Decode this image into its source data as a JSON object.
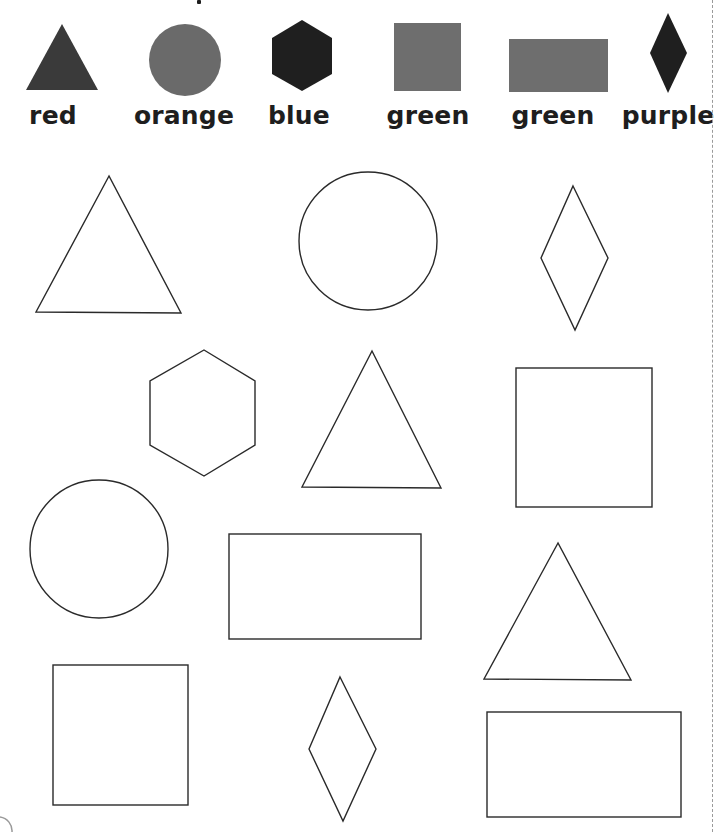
{
  "worksheet": {
    "title_fragment": "",
    "key": [
      {
        "shape": "triangle",
        "color_word": "red",
        "fill": "#3a3a3a",
        "label_x": 53,
        "points": "26,90 62,24 98,90"
      },
      {
        "shape": "circle",
        "color_word": "orange",
        "fill": "#6a6a6a",
        "label_x": 184,
        "cx": 185,
        "cy": 60,
        "r": 36
      },
      {
        "shape": "hexagon",
        "color_word": "blue",
        "fill": "#1f1f1f",
        "label_x": 299,
        "points": "302,20 332,38 332,74 302,91 272,74 272,38"
      },
      {
        "shape": "square",
        "color_word": "green",
        "fill": "#6e6e6e",
        "label_x": 428,
        "x": 394,
        "y": 23,
        "w": 67,
        "h": 68
      },
      {
        "shape": "rectangle",
        "color_word": "green",
        "fill": "#6e6e6e",
        "label_x": 553,
        "x": 509,
        "y": 39,
        "w": 99,
        "h": 53
      },
      {
        "shape": "rhombus",
        "color_word": "purple",
        "fill": "#1f1f1f",
        "label_x": 668,
        "points": "668,13 687,53 668,93 650,53"
      }
    ],
    "outline_shapes": [
      {
        "shape": "triangle",
        "row": 1,
        "points": "109,176 36,312 181,313"
      },
      {
        "shape": "circle",
        "row": 1,
        "cx": 368,
        "cy": 241,
        "r": 69
      },
      {
        "shape": "rhombus",
        "row": 1,
        "points": "573,186 608,258 575,330 541,258"
      },
      {
        "shape": "hexagon",
        "row": 2,
        "points": "204,350 255,381 255,445 204,476 150,445 150,381"
      },
      {
        "shape": "triangle",
        "row": 2,
        "points": "372,351 302,487 441,488"
      },
      {
        "shape": "square",
        "row": 2,
        "x": 516,
        "y": 368,
        "w": 136,
        "h": 139
      },
      {
        "shape": "circle",
        "row": 3,
        "cx": 99,
        "cy": 549,
        "r": 69
      },
      {
        "shape": "rectangle",
        "row": 3,
        "x": 229,
        "y": 534,
        "w": 192,
        "h": 105
      },
      {
        "shape": "triangle",
        "row": 3,
        "points": "558,543 484,679 631,680"
      },
      {
        "shape": "square",
        "row": 4,
        "x": 53,
        "y": 665,
        "w": 135,
        "h": 140
      },
      {
        "shape": "rhombus",
        "row": 4,
        "points": "340,677 376,749 343,821 309,749"
      },
      {
        "shape": "rectangle",
        "row": 4,
        "x": 487,
        "y": 712,
        "w": 194,
        "h": 105
      }
    ],
    "colors": {
      "outline_stroke": "#2a2a2a",
      "label_text": "#1e1e1e",
      "cut_line": "#9a9a9a",
      "background": "#ffffff"
    }
  }
}
